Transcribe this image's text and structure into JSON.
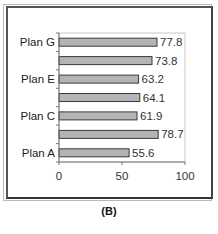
{
  "caption": "(B)",
  "chart_data": {
    "type": "bar",
    "orientation": "horizontal",
    "title": "",
    "xlabel": "",
    "ylabel": "",
    "categories": [
      "Plan A",
      "Plan B",
      "Plan C",
      "Plan D",
      "Plan E",
      "Plan F",
      "Plan G"
    ],
    "category_labels_shown": [
      "Plan A",
      "",
      "Plan C",
      "",
      "Plan E",
      "",
      "Plan G"
    ],
    "values": [
      55.6,
      78.7,
      61.9,
      64.1,
      63.2,
      73.8,
      77.8
    ],
    "data_labels": [
      "55.6",
      "78.7",
      "61.9",
      "64.1",
      "63.2",
      "73.8",
      "77.8"
    ],
    "xlim": [
      0,
      100
    ],
    "xticks": [
      0,
      50,
      100
    ],
    "xtick_labels": [
      "0",
      "50",
      "100"
    ],
    "grid": false,
    "legend": "none",
    "colors": {
      "bar_fill": "#b4b4b4",
      "bar_stroke": "#3a3a3a",
      "axis": "#777777",
      "plot_border": "#c8c8c8"
    }
  }
}
